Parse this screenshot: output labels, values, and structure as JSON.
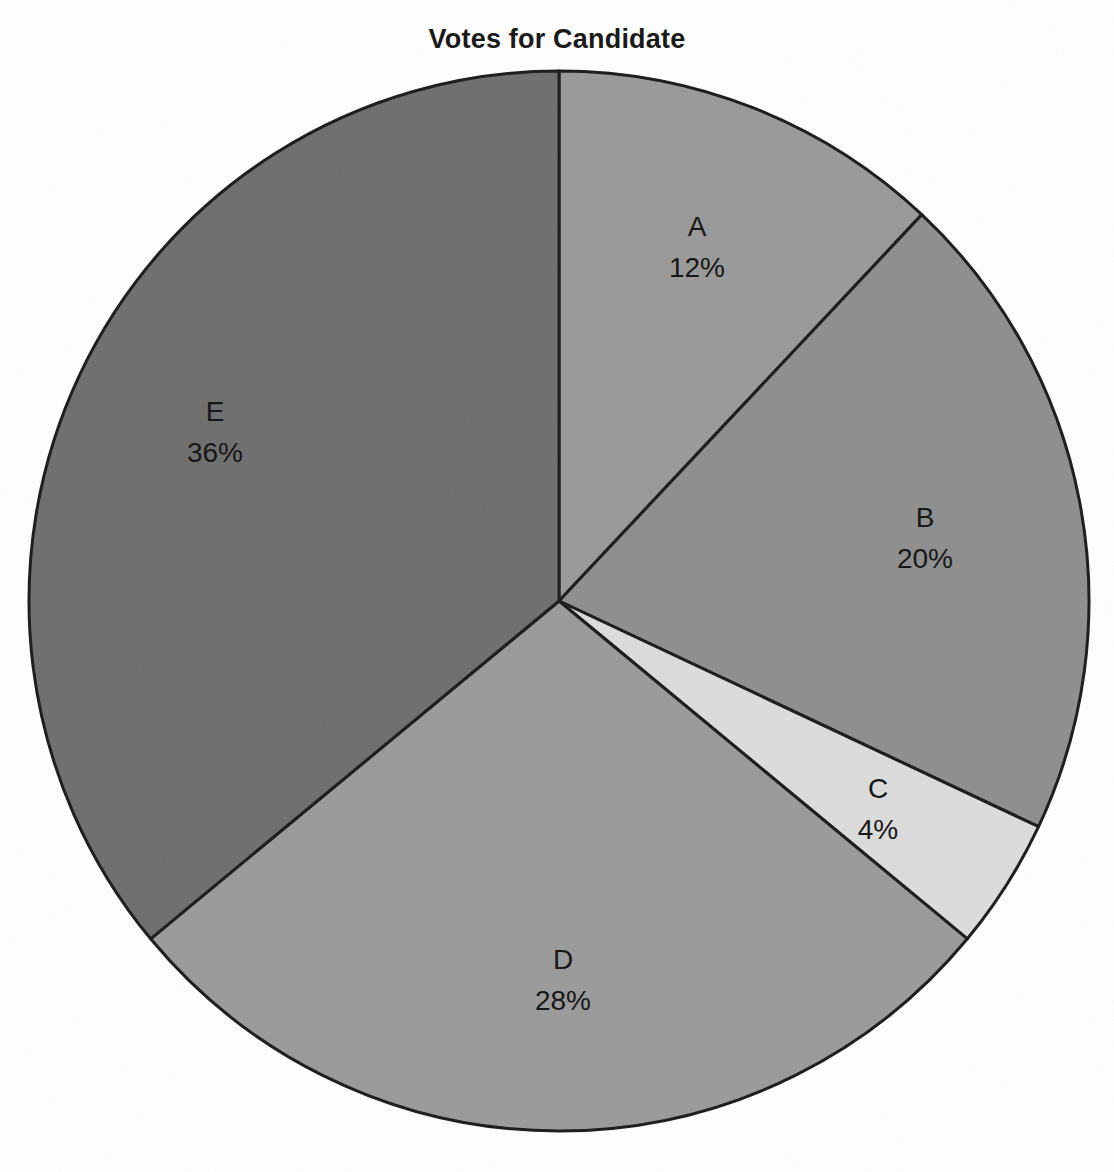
{
  "figure": {
    "title": "Votes for Candidate",
    "background_color": "#ffffff",
    "outline_color": "#1a1a1a"
  },
  "chart_data": {
    "type": "pie",
    "title": "Votes for Candidate",
    "xlabel": "",
    "ylabel": "",
    "units": "percent",
    "start_angle_deg": 90,
    "direction": "clockwise",
    "total": 100,
    "legend": "none",
    "grid": false,
    "categories": [
      "A",
      "B",
      "C",
      "D",
      "E"
    ],
    "values": [
      12,
      20,
      4,
      28,
      36
    ],
    "labels": [
      "12%",
      "20%",
      "4%",
      "28%",
      "36%"
    ],
    "colors": [
      "#999999",
      "#8e8e8e",
      "#dcdcdc",
      "#9a9a9a",
      "#6e6e6e"
    ],
    "slices": [
      {
        "name": "A",
        "value": 12,
        "label": "12%",
        "color": "#999999",
        "start_deg": 0,
        "end_deg": 43.2,
        "label_x": 697,
        "label_y": 236,
        "value_x": 697,
        "value_y": 277
      },
      {
        "name": "B",
        "value": 20,
        "label": "20%",
        "color": "#8e8e8e",
        "start_deg": 43.2,
        "end_deg": 115.2,
        "label_x": 925,
        "label_y": 527,
        "value_x": 925,
        "value_y": 568
      },
      {
        "name": "C",
        "value": 4,
        "label": "4%",
        "color": "#dcdcdc",
        "start_deg": 115.2,
        "end_deg": 129.6,
        "label_x": 878,
        "label_y": 798,
        "value_x": 878,
        "value_y": 839
      },
      {
        "name": "D",
        "value": 28,
        "label": "28%",
        "color": "#9a9a9a",
        "start_deg": 129.6,
        "end_deg": 230.4,
        "label_x": 563,
        "label_y": 969,
        "value_x": 563,
        "value_y": 1010
      },
      {
        "name": "E",
        "value": 36,
        "label": "36%",
        "color": "#6e6e6e",
        "start_deg": 230.4,
        "end_deg": 360,
        "label_x": 215,
        "label_y": 421,
        "value_x": 215,
        "value_y": 462
      }
    ],
    "geometry": {
      "center_x": 559,
      "center_y": 601,
      "radius": 530
    }
  }
}
